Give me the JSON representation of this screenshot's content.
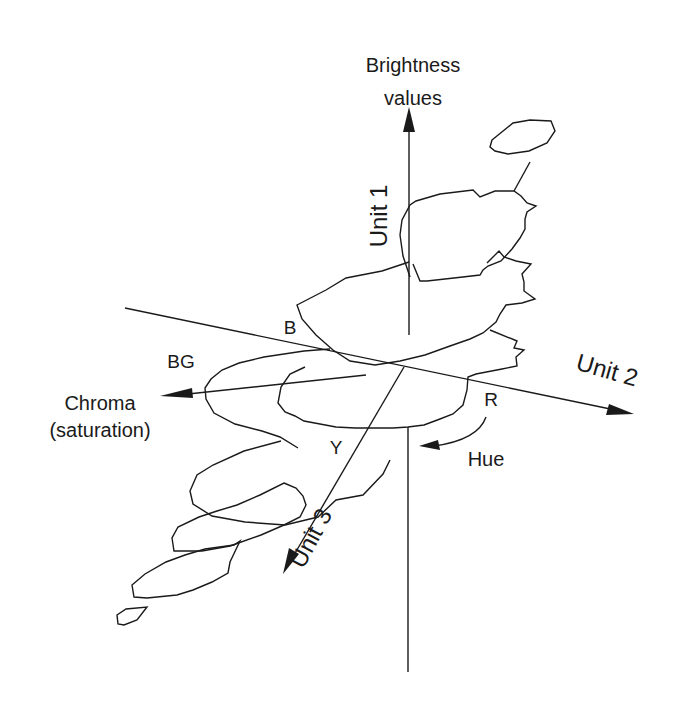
{
  "figure": {
    "type": "3d color space diagram",
    "stroke_color": "#1a1a1a",
    "background": "#ffffff"
  },
  "axes": {
    "unit1": {
      "label": "Unit  1",
      "title_line1": "Brightness",
      "title_line2": "values"
    },
    "unit2": {
      "label": "Unit  2"
    },
    "unit3": {
      "label": "Unit  3"
    },
    "chroma": {
      "line1": "Chroma",
      "line2": "(saturation)"
    },
    "hue": {
      "label": "Hue"
    }
  },
  "hue_markers": {
    "blue": "B",
    "blue_green": "BG",
    "yellow": "Y",
    "red": "R"
  }
}
